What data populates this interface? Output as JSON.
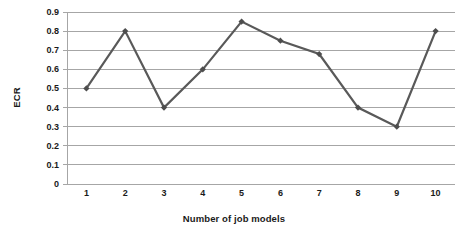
{
  "chart_data": {
    "type": "line",
    "title": "",
    "xlabel": "Number of job models",
    "ylabel": "ECR",
    "categories": [
      "1",
      "2",
      "3",
      "4",
      "5",
      "6",
      "7",
      "8",
      "9",
      "10"
    ],
    "x": [
      1,
      2,
      3,
      4,
      5,
      6,
      7,
      8,
      9,
      10
    ],
    "values": [
      0.5,
      0.8,
      0.4,
      0.6,
      0.85,
      0.75,
      0.68,
      0.4,
      0.3,
      0.8
    ],
    "series": [
      {
        "name": "ECR",
        "values": [
          0.5,
          0.8,
          0.4,
          0.6,
          0.85,
          0.75,
          0.68,
          0.4,
          0.3,
          0.8
        ]
      }
    ],
    "ylim": [
      0,
      0.9
    ],
    "xlim": [
      1,
      10
    ],
    "ytick_labels": [
      "0",
      "0.1",
      "0.2",
      "0.3",
      "0.4",
      "0.5",
      "0.6",
      "0.7",
      "0.8",
      "0.9"
    ],
    "ytick_values": [
      0,
      0.1,
      0.2,
      0.3,
      0.4,
      0.5,
      0.6,
      0.7,
      0.8,
      0.9
    ],
    "grid": "horizontal",
    "legend": "none",
    "marker": "diamond",
    "line_color": "#595959",
    "marker_color": "#4d4d4d",
    "grid_color": "#a6a6a6",
    "axis_color": "#a6a6a6",
    "background": "#ffffff",
    "text_color": "#1a1a1a"
  }
}
